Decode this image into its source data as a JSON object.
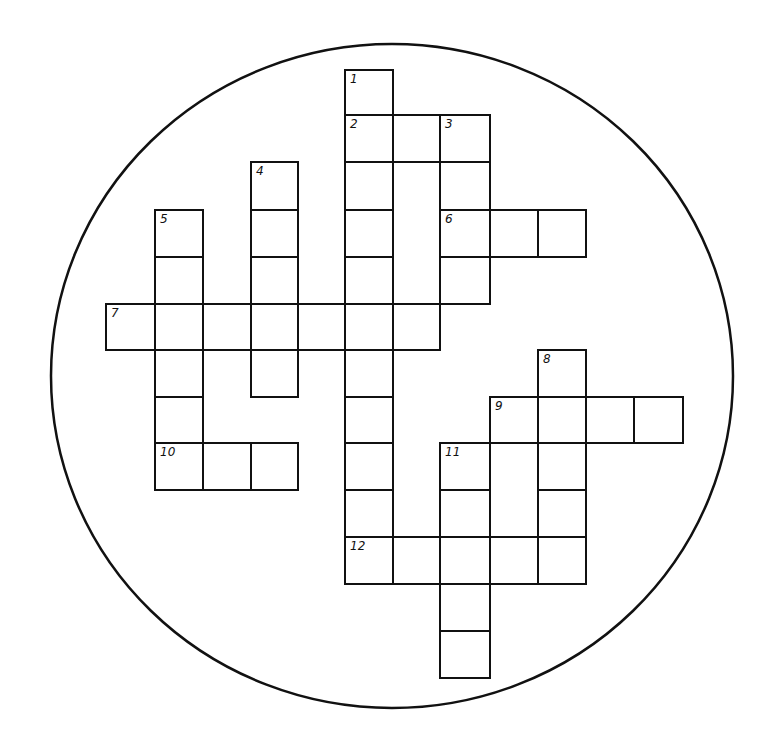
{
  "puzzle": {
    "type": "crossword",
    "frame": {
      "shape": "circle",
      "cx": 392,
      "cy": 376,
      "rx": 341,
      "ry": 332,
      "stroke": "#111111"
    },
    "grid": {
      "col_lines": [
        106,
        155,
        203,
        251,
        298,
        345,
        393,
        440,
        490,
        538,
        586,
        634,
        683
      ],
      "row_lines": [
        70,
        115,
        162,
        210,
        257,
        304,
        350,
        397,
        443,
        490,
        537,
        584,
        631,
        678
      ]
    },
    "line_color": "#111111",
    "entries": [
      {
        "number": "1",
        "direction": "down",
        "row": 0,
        "col": 5,
        "length": 11
      },
      {
        "number": "2",
        "direction": "across",
        "row": 1,
        "col": 5,
        "length": 3
      },
      {
        "number": "3",
        "direction": "down",
        "row": 1,
        "col": 7,
        "length": 4
      },
      {
        "number": "4",
        "direction": "down",
        "row": 2,
        "col": 3,
        "length": 5
      },
      {
        "number": "5",
        "direction": "down",
        "row": 3,
        "col": 1,
        "length": 6
      },
      {
        "number": "6",
        "direction": "across",
        "row": 3,
        "col": 7,
        "length": 3
      },
      {
        "number": "7",
        "direction": "across",
        "row": 5,
        "col": 0,
        "length": 7
      },
      {
        "number": "8",
        "direction": "down",
        "row": 6,
        "col": 9,
        "length": 5
      },
      {
        "number": "9",
        "direction": "across",
        "row": 7,
        "col": 8,
        "length": 4
      },
      {
        "number": "10",
        "direction": "across",
        "row": 8,
        "col": 1,
        "length": 3
      },
      {
        "number": "11",
        "direction": "down",
        "row": 8,
        "col": 7,
        "length": 5
      },
      {
        "number": "12",
        "direction": "across",
        "row": 10,
        "col": 5,
        "length": 5
      }
    ]
  }
}
